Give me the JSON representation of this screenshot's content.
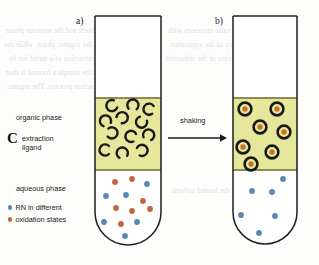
{
  "figure": {
    "background_color": "#fdfdfb",
    "ghost_text_color": "#d9d9dd",
    "bleed_lines": [
      "the solvent and the aqueous phase",
      "in the organic phase, while the",
      "of the extraction of a metal ion by",
      "and the complex formed is then",
      "extraction process. The organic",
      "distribution ratio increases with",
      "the chemistry of the separation",
      "as in the case of the reductive",
      "stripping of the loaded solvent"
    ]
  },
  "panels": {
    "a": {
      "label": "a)"
    },
    "b": {
      "label": "b)"
    }
  },
  "process": {
    "arrow_label": "shaking",
    "arrow_direction": "right",
    "arrow_color": "#1b1b1b"
  },
  "labels": {
    "organic_phase": "organic phase",
    "extraction_ligand_line1": "extraction",
    "extraction_ligand_line2": "ligand",
    "ligand_glyph": "C",
    "aqueous_phase": "aqueous phase"
  },
  "legend": {
    "items": [
      {
        "marker": "blue-dot",
        "color": "#5b87b4",
        "text": "RN in different"
      },
      {
        "marker": "orange-dot",
        "color": "#c2663c",
        "text": "oxidation states"
      }
    ]
  },
  "colors": {
    "organic_phase_fill": "#e6e79b",
    "organic_phase_border": "#6b6b2a",
    "aqueous_phase_fill": "#ffffff",
    "tube_outline": "#1f1f1f",
    "ligand_stroke": "#1a1a1a",
    "rn_blue": "#5b87b4",
    "rn_orange": "#c2663c",
    "complex_ring": "#1a1a1a",
    "complex_core": "#c2722f"
  },
  "tube_a": {
    "x": 95,
    "y": 16,
    "width": 66,
    "height": 229,
    "organic_top": 98,
    "organic_bottom": 170,
    "ligand_count": 12,
    "ligands": [
      {
        "x": 16,
        "y": 6,
        "rot": -25
      },
      {
        "x": 38,
        "y": 4,
        "rot": 95
      },
      {
        "x": 51,
        "y": 9,
        "rot": 10
      },
      {
        "x": 8,
        "y": 20,
        "rot": 65
      },
      {
        "x": 27,
        "y": 17,
        "rot": 140
      },
      {
        "x": 44,
        "y": 23,
        "rot": -60
      },
      {
        "x": 17,
        "y": 33,
        "rot": 185
      },
      {
        "x": 34,
        "y": 36,
        "rot": 20
      },
      {
        "x": 52,
        "y": 34,
        "rot": 110
      },
      {
        "x": 7,
        "y": 50,
        "rot": 0
      },
      {
        "x": 26,
        "y": 52,
        "rot": 75
      },
      {
        "x": 47,
        "y": 50,
        "rot": 160
      }
    ],
    "aqueous_dots": [
      {
        "x": 20,
        "y": 12,
        "color": "orange"
      },
      {
        "x": 37,
        "y": 9,
        "color": "orange"
      },
      {
        "x": 52,
        "y": 14,
        "color": "blue"
      },
      {
        "x": 11,
        "y": 26,
        "color": "blue"
      },
      {
        "x": 31,
        "y": 25,
        "color": "blue"
      },
      {
        "x": 48,
        "y": 31,
        "color": "orange"
      },
      {
        "x": 21,
        "y": 38,
        "color": "orange"
      },
      {
        "x": 37,
        "y": 41,
        "color": "orange"
      },
      {
        "x": 55,
        "y": 39,
        "color": "orange"
      },
      {
        "x": 9,
        "y": 52,
        "color": "blue"
      },
      {
        "x": 26,
        "y": 54,
        "color": "orange"
      },
      {
        "x": 42,
        "y": 52,
        "color": "blue"
      },
      {
        "x": 30,
        "y": 66,
        "color": "blue"
      }
    ]
  },
  "tube_b": {
    "x": 233,
    "y": 16,
    "width": 64,
    "height": 229,
    "organic_top": 98,
    "organic_bottom": 170,
    "complex_count": 7,
    "complexes": [
      {
        "x": 9,
        "y": 7
      },
      {
        "x": 38,
        "y": 7
      },
      {
        "x": 23,
        "y": 24
      },
      {
        "x": 46,
        "y": 28
      },
      {
        "x": 6,
        "y": 43
      },
      {
        "x": 34,
        "y": 48
      },
      {
        "x": 14,
        "y": 63
      }
    ],
    "aqueous_dots": [
      {
        "x": 50,
        "y": 9,
        "color": "blue"
      },
      {
        "x": 19,
        "y": 21,
        "color": "blue"
      },
      {
        "x": 39,
        "y": 22,
        "color": "blue"
      },
      {
        "x": 8,
        "y": 45,
        "color": "blue"
      },
      {
        "x": 42,
        "y": 46,
        "color": "blue"
      },
      {
        "x": 26,
        "y": 63,
        "color": "blue"
      }
    ]
  }
}
